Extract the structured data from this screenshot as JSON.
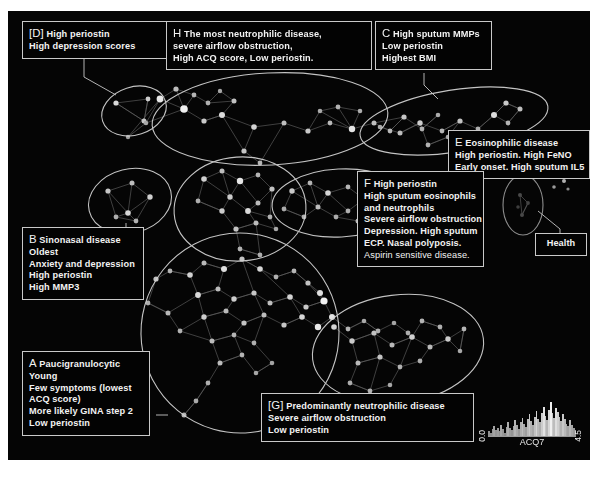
{
  "figure": {
    "background": "#050505",
    "node_color": "#cfcfcf",
    "edge_color": "#6e6e6e",
    "ellipse_color": "#d5d5d5"
  },
  "annotations": [
    {
      "id": "D",
      "name": "annotation-box-d",
      "key": "[D]",
      "lines": [
        "High periostin",
        "High depression scores"
      ],
      "first_line_rest": "High periostin"
    },
    {
      "id": "H",
      "name": "annotation-box-h",
      "key": "H",
      "lines": [
        "The most neutrophilic disease,",
        "severe airflow obstruction,",
        "High ACQ score, Low periostin."
      ],
      "first_line_rest": "The most neutrophilic disease,"
    },
    {
      "id": "C",
      "name": "annotation-box-c",
      "key": "C",
      "lines": [
        "High sputum MMPs",
        "Low periostin",
        "Highest BMI"
      ],
      "first_line_rest": "High sputum MMPs"
    },
    {
      "id": "E",
      "name": "annotation-box-e",
      "key": "E",
      "lines": [
        "Eosinophilic disease",
        "High periostin. High FeNO",
        "Early onset. High sputum IL5"
      ],
      "first_line_rest": "Eosinophilic disease"
    },
    {
      "id": "F",
      "name": "annotation-box-f",
      "key": "F",
      "lines": [
        "High periostin",
        "High sputum eosinophils",
        "and neutrophils",
        "Severe airflow obstruction",
        "Depression. High sputum",
        "ECP. Nasal polyposis.",
        "Aspirin sensitive disease."
      ],
      "first_line_rest": "High periostin"
    },
    {
      "id": "B",
      "name": "annotation-box-b",
      "key": "B",
      "lines": [
        "Sinonasal disease",
        "Oldest",
        "Anxiety and depression",
        "High periostin",
        "High MMP3"
      ],
      "first_line_rest": "Sinonasal disease"
    },
    {
      "id": "A",
      "name": "annotation-box-a",
      "key": "A",
      "lines": [
        "Paucigranulocytic",
        "Young",
        "Few symptoms (lowest",
        "ACQ score)",
        "More likely GINA step 2",
        "Low periostin"
      ],
      "first_line_rest": "Paucigranulocytic"
    },
    {
      "id": "G",
      "name": "annotation-box-g",
      "key": "[G]",
      "lines": [
        "Predominantly neutrophilic disease",
        "Severe airflow obstruction",
        "Low periostin"
      ],
      "first_line_rest": "Predominantly neutrophilic disease"
    },
    {
      "id": "Health",
      "name": "annotation-box-health",
      "key": "",
      "lines": [
        "Health"
      ],
      "first_line_rest": "Health"
    }
  ],
  "box_text": {
    "d_key": "[D]",
    "d_l1": "High periostin",
    "d_l2": "High depression scores",
    "h_key": "H",
    "h_l1": "The most neutrophilic disease,",
    "h_l2": "severe airflow obstruction,",
    "h_l3": "High ACQ score, Low periostin.",
    "c_key": "C",
    "c_l1": "High sputum MMPs",
    "c_l2": "Low periostin",
    "c_l3": "Highest BMI",
    "e_key": "E",
    "e_l1": "Eosinophilic disease",
    "e_l2": "High periostin. High FeNO",
    "e_l3": "Early onset. High sputum IL5",
    "f_key": "F",
    "f_l1": "High periostin",
    "f_l2": "High sputum eosinophils",
    "f_l3": "and neutrophils",
    "f_l4": "Severe airflow obstruction",
    "f_l5": "Depression. High sputum",
    "f_l6": "ECP. Nasal polyposis.",
    "f_l7": "Aspirin sensitive disease.",
    "b_key": "B",
    "b_l1": "Sinonasal disease",
    "b_l2": "Oldest",
    "b_l3": "Anxiety and depression",
    "b_l4": "High periostin",
    "b_l5": "High MMP3",
    "a_key": "A",
    "a_l1": "Paucigranulocytic",
    "a_l2": "Young",
    "a_l3": "Few symptoms (lowest",
    "a_l4": "ACQ score)",
    "a_l5": "More likely GINA step 2",
    "a_l6": "Low periostin",
    "g_key": "[G]",
    "g_l1": "Predominantly neutrophilic disease",
    "g_l2": "Severe airflow obstruction",
    "g_l3": "Low periostin",
    "health_label": "Health"
  },
  "legend": {
    "label": "ACQ7",
    "min": "0.0",
    "max": "4.5",
    "bars": [
      4,
      3,
      6,
      9,
      5,
      7,
      4,
      10,
      6,
      3,
      8,
      12,
      7,
      5,
      9,
      14,
      10,
      6,
      12,
      16,
      11,
      8,
      15,
      19,
      13,
      10,
      17,
      22,
      15,
      12,
      20,
      26,
      18,
      14,
      23,
      30,
      20,
      16,
      25,
      21,
      17,
      13,
      19,
      15,
      11,
      9,
      14,
      10,
      7,
      5
    ]
  },
  "chart_data": {
    "type": "scatter",
    "title": "",
    "xlabel": "",
    "ylabel": "",
    "legend_position": "bottom-right",
    "grid": false,
    "colorbar": {
      "label": "ACQ7",
      "min": 0.0,
      "max": 4.5
    },
    "clusters": [
      {
        "id": "A",
        "label": "Paucigranulocytic",
        "cx": 228,
        "cy": 320,
        "rx": 96,
        "ry": 98,
        "rot": -8
      },
      {
        "id": "B",
        "label": "Sinonasal disease",
        "cx": 128,
        "cy": 196,
        "rx": 42,
        "ry": 32,
        "rot": -12
      },
      {
        "id": "C",
        "label": "High sputum MMPs",
        "cx": 444,
        "cy": 108,
        "rx": 95,
        "ry": 30,
        "rot": -9
      },
      {
        "id": "D",
        "label": "High periostin / depression",
        "cx": 126,
        "cy": 100,
        "rx": 33,
        "ry": 24,
        "rot": -18
      },
      {
        "id": "E",
        "label": "Eosinophilic disease",
        "cx": 330,
        "cy": 193,
        "rx": 68,
        "ry": 34,
        "rot": -4
      },
      {
        "id": "F",
        "label": "High periostin severe",
        "cx": 243,
        "cy": 196,
        "rx": 62,
        "ry": 50,
        "rot": 0
      },
      {
        "id": "G",
        "label": "Predominantly neutrophilic",
        "cx": 380,
        "cy": 322,
        "rx": 82,
        "ry": 52,
        "rot": -6
      },
      {
        "id": "H",
        "label": "Most neutrophilic disease",
        "cx": 260,
        "cy": 107,
        "rx": 116,
        "ry": 45,
        "rot": -3
      },
      {
        "id": "Health",
        "label": "Health",
        "cx": 516,
        "cy": 196,
        "rx": 20,
        "ry": 29,
        "rot": 0
      }
    ]
  }
}
